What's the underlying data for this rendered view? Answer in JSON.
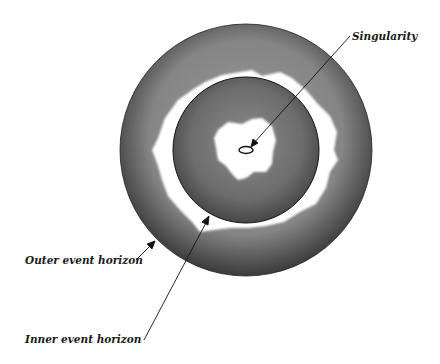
{
  "diagram": {
    "labels": {
      "singularity": "Singularity",
      "outer_horizon": "Outer event horizon",
      "inner_horizon": "Inner event horizon"
    },
    "colors": {
      "background": "#ffffff",
      "outer_region_edge": "#3e3e3e",
      "outer_region_mid": "#8a8a8a",
      "inner_region_edge": "#454545",
      "inner_region_mid": "#7c7c7c",
      "glow": "#ffffff",
      "stroke": "#111111"
    },
    "geometry": {
      "center": [
        246,
        150
      ],
      "outer_radius": 126,
      "inner_radius": 73,
      "singularity_rx": 7,
      "singularity_ry": 3.5
    }
  }
}
